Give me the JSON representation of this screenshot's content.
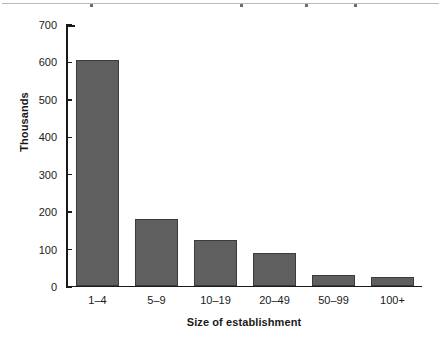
{
  "chart_data": {
    "type": "bar",
    "title": "",
    "subtitle": "",
    "xlabel": "Size of establishment",
    "ylabel": "Thousands",
    "categories": [
      "1–4",
      "5–9",
      "10–19",
      "20–49",
      "50–99",
      "100+"
    ],
    "values": [
      607,
      178,
      122,
      88,
      27,
      22
    ],
    "ylim": [
      0,
      700
    ],
    "yticks": [
      0,
      100,
      200,
      300,
      400,
      500,
      600,
      700
    ],
    "ytick_labels": [
      "0",
      "100",
      "200",
      "300",
      "400",
      "500",
      "600",
      "700"
    ],
    "grid": false,
    "legend": null,
    "bar_color": "#5f5f5f",
    "bar_edge_color": "#3b3b3b",
    "axis_color": "#1a1a1a",
    "background_color": "#ffffff"
  }
}
